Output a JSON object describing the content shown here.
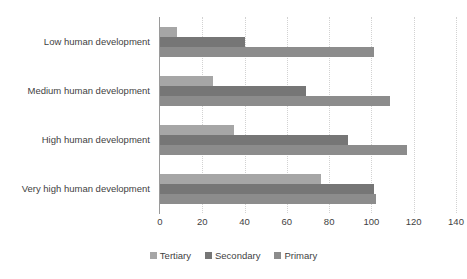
{
  "chart_data": {
    "type": "bar",
    "orientation": "horizontal",
    "title": "",
    "subtitle": "",
    "xlabel": "",
    "ylabel": "",
    "categories": [
      "Low human development",
      "Medium human development",
      "High human development",
      "Very high human development"
    ],
    "series": [
      {
        "name": "Tertiary",
        "color": "#a6a6a6",
        "values": [
          8,
          25,
          35,
          76
        ]
      },
      {
        "name": "Secondary",
        "color": "#767676",
        "values": [
          40,
          69,
          89,
          101
        ]
      },
      {
        "name": "Primary",
        "color": "#8c8c8c",
        "values": [
          101,
          109,
          117,
          102
        ]
      }
    ],
    "xlim": [
      0,
      140
    ],
    "xticks": [
      0,
      20,
      40,
      60,
      80,
      100,
      120,
      140
    ],
    "xtick_labels": [
      "0",
      "20",
      "40",
      "60",
      "80",
      "100",
      "120",
      "140"
    ],
    "grid": true,
    "grid_axis": "x",
    "grid_style": "dotted",
    "grid_color": "#d2d2d2",
    "legend": {
      "position": "bottom",
      "entries": [
        {
          "label": "Tertiary",
          "color": "#a6a6a6"
        },
        {
          "label": "Secondary",
          "color": "#767676"
        },
        {
          "label": "Primary",
          "color": "#8c8c8c"
        }
      ]
    },
    "axis_line_color": "#9a9a9a",
    "background_color": "#ffffff",
    "text_color": "#3f3f3f"
  }
}
